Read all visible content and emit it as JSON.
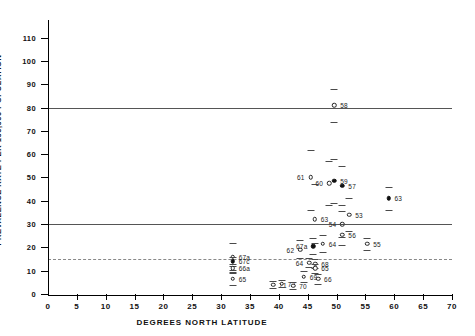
{
  "chart_data": {
    "type": "scatter",
    "title": "",
    "xlabel": "DEGREES NORTH LATITUDE",
    "ylabel": "PREVALENCE RATE PER 100,000 POPULATION",
    "xlim": [
      0,
      70
    ],
    "ylim": [
      0,
      115
    ],
    "xticks": [
      0,
      5,
      10,
      15,
      20,
      25,
      30,
      35,
      40,
      45,
      50,
      55,
      60,
      65,
      70
    ],
    "xticklabels": [
      "0",
      "5",
      "10",
      "15",
      "20",
      "25",
      "30",
      "35",
      "40",
      "45",
      "50",
      "55",
      "60",
      "65",
      "70"
    ],
    "yticks": [
      0,
      10,
      20,
      30,
      40,
      50,
      60,
      70,
      80,
      90,
      100,
      110
    ],
    "yticklabels": [
      "0",
      "10",
      "20",
      "30",
      "40",
      "50",
      "60",
      "70",
      "80",
      "90",
      "100",
      "110"
    ],
    "grid": false,
    "legend": null,
    "reference_lines": [
      {
        "name": "upper-solid-line",
        "y": 80,
        "style": "solid"
      },
      {
        "name": "middle-solid-line",
        "y": 30,
        "style": "solid"
      },
      {
        "name": "lower-dashed-line",
        "y": 15,
        "style": "dashed"
      }
    ],
    "error_bars": true,
    "points": [
      {
        "label": "67a",
        "x": 32.0,
        "y": 16.0,
        "ylow": 22.0,
        "yhigh": 10.5,
        "marker": "open",
        "labelside": "right"
      },
      {
        "label": "67c",
        "x": 32.0,
        "y": 14.0,
        "ylow": 16.0,
        "yhigh": 12.0,
        "marker": "filled",
        "labelside": "right"
      },
      {
        "label": "66a",
        "x": 32.0,
        "y": 11.0,
        "ylow": 13.0,
        "yhigh": 9.0,
        "marker": "open",
        "labelside": "right"
      },
      {
        "label": "65",
        "x": 32.0,
        "y": 6.5,
        "ylow": 9.5,
        "yhigh": 4.0,
        "marker": "open",
        "labelside": "right"
      },
      {
        "label": "71",
        "x": 39.0,
        "y": 4.0,
        "ylow": 5.5,
        "yhigh": 2.5,
        "marker": "open",
        "labelside": "right"
      },
      {
        "label": "72",
        "x": 40.5,
        "y": 4.5,
        "ylow": 6.0,
        "yhigh": 3.0,
        "marker": "open",
        "labelside": "right"
      },
      {
        "label": "70",
        "x": 42.5,
        "y": 3.5,
        "ylow": 5.0,
        "yhigh": 2.0,
        "marker": "open",
        "labelside": "right"
      },
      {
        "label": "62",
        "x": 43.7,
        "y": 19.0,
        "ylow": 23.0,
        "yhigh": 15.5,
        "marker": "open",
        "labelside": "left"
      },
      {
        "label": "69",
        "x": 44.3,
        "y": 7.5,
        "ylow": 10.0,
        "yhigh": 5.0,
        "marker": "open",
        "labelside": "right"
      },
      {
        "label": "64",
        "x": 45.3,
        "y": 13.5,
        "ylow": 15.5,
        "yhigh": 11.5,
        "marker": "open",
        "labelside": "left"
      },
      {
        "label": "67a",
        "x": 46.0,
        "y": 20.5,
        "ylow": 24.0,
        "yhigh": 17.0,
        "marker": "filled",
        "labelside": "left"
      },
      {
        "label": "68",
        "x": 46.3,
        "y": 13.0,
        "ylow": 15.0,
        "yhigh": 11.0,
        "marker": "open",
        "labelside": "right"
      },
      {
        "label": "65",
        "x": 46.3,
        "y": 11.0,
        "ylow": 13.0,
        "yhigh": 9.0,
        "marker": "open",
        "labelside": "right"
      },
      {
        "label": "66",
        "x": 46.8,
        "y": 6.5,
        "ylow": 8.5,
        "yhigh": 4.5,
        "marker": "open",
        "labelside": "right"
      },
      {
        "label": "64",
        "x": 47.6,
        "y": 21.5,
        "ylow": 25.5,
        "yhigh": 18.0,
        "marker": "open",
        "labelside": "right"
      },
      {
        "label": "61",
        "x": 45.5,
        "y": 50.0,
        "ylow": 62.0,
        "yhigh": 36.0,
        "marker": "open",
        "labelside": "left"
      },
      {
        "label": "63",
        "x": 46.2,
        "y": 32.0,
        "ylow": 47.0,
        "yhigh": 22.0,
        "marker": "open",
        "labelside": "right"
      },
      {
        "label": "60",
        "x": 48.7,
        "y": 47.5,
        "ylow": 57.0,
        "yhigh": 38.0,
        "marker": "open",
        "labelside": "left"
      },
      {
        "label": "59",
        "x": 49.6,
        "y": 48.5,
        "ylow": 58.0,
        "yhigh": 39.0,
        "marker": "filled",
        "labelside": "right"
      },
      {
        "label": "58",
        "x": 49.6,
        "y": 81.0,
        "ylow": 88.0,
        "yhigh": 74.0,
        "marker": "open",
        "labelside": "right"
      },
      {
        "label": "57",
        "x": 51.0,
        "y": 46.5,
        "ylow": 55.0,
        "yhigh": 38.0,
        "marker": "filled",
        "labelside": "right"
      },
      {
        "label": "54",
        "x": 51.0,
        "y": 30.0,
        "ylow": 35.5,
        "yhigh": 24.5,
        "marker": "open",
        "labelside": "left"
      },
      {
        "label": "56",
        "x": 51.0,
        "y": 25.5,
        "ylow": 30.0,
        "yhigh": 21.0,
        "marker": "open",
        "labelside": "right"
      },
      {
        "label": "53",
        "x": 52.2,
        "y": 34.0,
        "ylow": 41.0,
        "yhigh": 27.0,
        "marker": "open",
        "labelside": "right"
      },
      {
        "label": "55",
        "x": 55.3,
        "y": 21.5,
        "ylow": 24.0,
        "yhigh": 19.0,
        "marker": "open",
        "labelside": "right"
      },
      {
        "label": "63",
        "x": 59.0,
        "y": 41.0,
        "ylow": 46.0,
        "yhigh": 36.0,
        "marker": "filled",
        "labelside": "right"
      }
    ]
  }
}
